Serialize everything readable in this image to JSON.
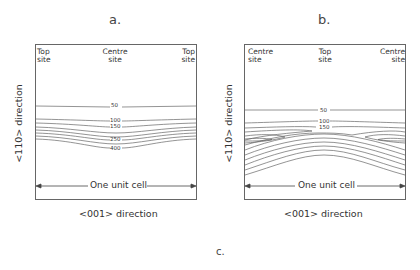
{
  "panels": [
    {
      "id": "a",
      "label": "a.",
      "sites": {
        "left": [
          "Top",
          "site"
        ],
        "center": [
          "Centre",
          "site"
        ],
        "right": [
          "Top",
          "site"
        ]
      },
      "contour_labels": [
        "50",
        "100",
        "150",
        "250",
        "400"
      ],
      "span_label": "One unit cell",
      "xlabel": "<001> direction",
      "ylabel": "<110> direction"
    },
    {
      "id": "b",
      "label": "b.",
      "sites": {
        "left": [
          "Centre",
          "site"
        ],
        "center": [
          "Top",
          "site"
        ],
        "right": [
          "Centre",
          "site"
        ]
      },
      "contour_labels": [
        "50",
        "100",
        "150"
      ],
      "span_label": "One unit cell",
      "xlabel": "<001> direction",
      "ylabel": "<110> direction"
    }
  ],
  "caption_label": "c."
}
